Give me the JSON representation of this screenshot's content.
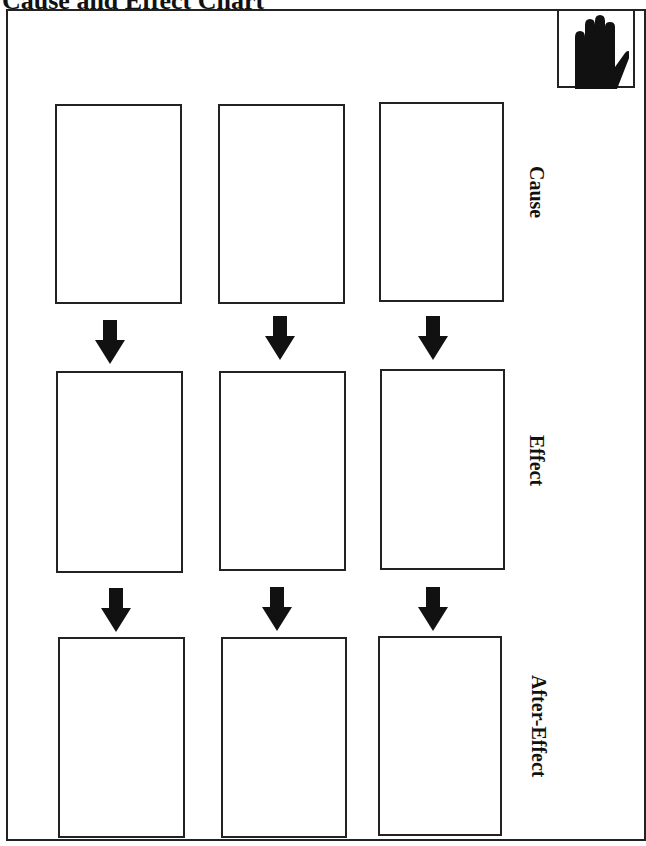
{
  "header": {
    "title": "Cause and Effect Chart"
  },
  "icons": {
    "corner": "raised-hand-icon",
    "connector": "down-arrow-icon"
  },
  "rows": [
    {
      "label": "Cause",
      "boxes": [
        "",
        "",
        ""
      ]
    },
    {
      "label": "Effect",
      "boxes": [
        "",
        "",
        ""
      ]
    },
    {
      "label": "After-Effect",
      "boxes": [
        "",
        "",
        ""
      ]
    }
  ],
  "colors": {
    "ink": "#222222",
    "background": "#ffffff"
  }
}
